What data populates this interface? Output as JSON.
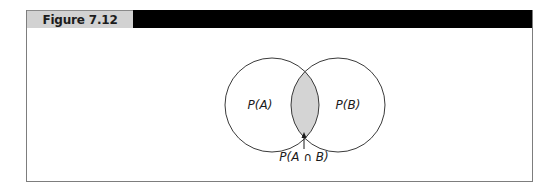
{
  "figure": {
    "label": "Figure 7.12",
    "header_bar_color": "#000000",
    "label_bg_color": "#d2d2d2"
  },
  "venn": {
    "sets": [
      {
        "name": "A",
        "label": "P(A)",
        "cx": 272,
        "cy": 105,
        "r": 47
      },
      {
        "name": "B",
        "label": "P(B)",
        "cx": 338,
        "cy": 105,
        "r": 47
      }
    ],
    "intersection": {
      "label": "P(A ∩ B)",
      "fill": "#d4d4d4",
      "arrow": "up"
    },
    "stroke_color": "#3a3a3a"
  }
}
